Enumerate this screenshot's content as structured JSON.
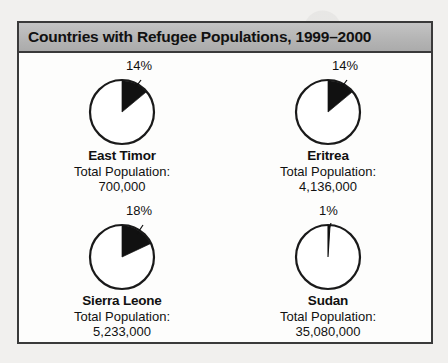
{
  "figure": {
    "title": "Countries with Refugee Populations, 1999–2000",
    "population_label": "Total Population:"
  },
  "chart_data": {
    "type": "pie",
    "title": "Countries with Refugee Populations, 1999–2000",
    "xlabel": "",
    "ylabel": "",
    "legend": "none",
    "grid": false,
    "note": "Each pie shows the shaded share of that country's total population that is refugees; wedges begin at 12 o'clock and sweep clockwise.",
    "series_name": "Refugee share of population",
    "categories": [
      "East Timor",
      "Eritrea",
      "Sierra Leone",
      "Sudan"
    ],
    "values": [
      14,
      14,
      18,
      1
    ],
    "value_labels": [
      "14%",
      "14%",
      "18%",
      "1%"
    ],
    "totals": [
      700000,
      4136000,
      5233000,
      35080000
    ],
    "total_labels": [
      "700,000",
      "4,136,000",
      "5,233,000",
      "35,080,000"
    ],
    "colors": {
      "wedge": "#111111",
      "remainder": "#ffffff",
      "outline": "#1a1a1a",
      "title_bar": "#b5b5b5",
      "frame": "#3a3a3a"
    },
    "charts": [
      {
        "country": "East Timor",
        "percent": 14,
        "percent_label": "14%",
        "total_population": 700000,
        "total_population_label": "700,000",
        "population_label": "Total Population:"
      },
      {
        "country": "Eritrea",
        "percent": 14,
        "percent_label": "14%",
        "total_population": 4136000,
        "total_population_label": "4,136,000",
        "population_label": "Total Population:"
      },
      {
        "country": "Sierra Leone",
        "percent": 18,
        "percent_label": "18%",
        "total_population": 5233000,
        "total_population_label": "5,233,000",
        "population_label": "Total Population:"
      },
      {
        "country": "Sudan",
        "percent": 1,
        "percent_label": "1%",
        "total_population": 35080000,
        "total_population_label": "35,080,000",
        "population_label": "Total Population:"
      }
    ]
  }
}
